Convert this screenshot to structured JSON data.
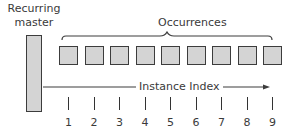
{
  "diagram": {
    "master_label": [
      "Recurring",
      "master"
    ],
    "occurrences_label": "Occurrences",
    "axis_label": "Instance Index",
    "occurrence_count": 9,
    "instance_indices": [
      "1",
      "2",
      "3",
      "4",
      "5",
      "6",
      "7",
      "8",
      "9"
    ],
    "colors": {
      "box_fill": "#d4d4d4",
      "stroke": "#3c3c3c"
    }
  }
}
